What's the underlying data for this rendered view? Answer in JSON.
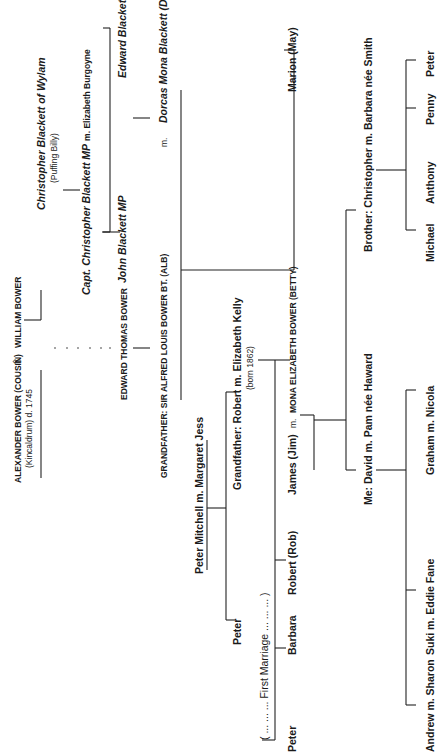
{
  "diagram": {
    "type": "family-tree",
    "orientation": "rotated-90-ccw",
    "nodes": {
      "alexander": {
        "name": "ALEXANDER BOWER (COUSIN)",
        "sub": "(Kincaldrum) d. 1745"
      },
      "arrow": "⇧",
      "william": {
        "name": "WILLIAM BOWER"
      },
      "edward_thomas": {
        "name": "EDWARD THOMAS BOWER"
      },
      "christopher_wylam": {
        "name": "Christopher Blackett of Wylam",
        "sub": "(Puffing Billy)"
      },
      "capt_christopher": {
        "name": "Capt. Christopher Blackett MP",
        "spouse": "m. Elizabeth Burgoyne"
      },
      "john_blackett": {
        "name": "John Blackett MP"
      },
      "edward_blackett": {
        "name": "Edward Blackett"
      },
      "grandfather_alb": {
        "name": "GRANDFATHER:  SIR ALFRED LOUIS BOWER BT. (ALB)",
        "m": "m.",
        "spouse": "Dorcas Mona Blackett (Darly)"
      },
      "peter_mitchell": {
        "name": "Peter Mitchell m. Margaret Jess"
      },
      "peter_son": {
        "name": "Peter"
      },
      "grandfather_robert": {
        "name": "Grandfather: Robert  m. Elizabeth Kelly",
        "sub": "(born 1862)"
      },
      "first_marriage": {
        "name": "(  ...   ...   ...  First Marriage  ...   ...   ...  )"
      },
      "peter_gc": {
        "name": "Peter"
      },
      "barbara": {
        "name": "Barbara"
      },
      "robert_rob": {
        "name": "Robert (Rob)"
      },
      "james": {
        "name": "James (Jim)",
        "m": "m.",
        "spouse": "MONA ELIZABETH BOWER (BETTY)"
      },
      "marion": {
        "name": "Marion (May)"
      },
      "me_david": {
        "name": "Me: David m. Pam née Haward"
      },
      "brother": {
        "name": "Brother:  Christopher m. Barbara née Smith"
      },
      "andrew": {
        "name": "Andrew m. Sharon"
      },
      "suki": {
        "name": "Suki m. Eddie Fane"
      },
      "graham": {
        "name": "Graham m. Nicola"
      },
      "michael": {
        "name": "Michael"
      },
      "anthony": {
        "name": "Anthony"
      },
      "penny": {
        "name": "Penny"
      },
      "peter_nephew": {
        "name": "Peter"
      }
    }
  }
}
